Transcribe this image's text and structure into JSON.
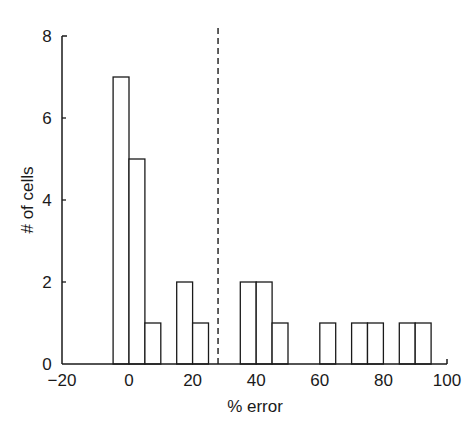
{
  "chart_data": {
    "type": "bar",
    "subtype": "histogram",
    "title": "",
    "xlabel": "% error",
    "ylabel": "# of cells",
    "xlim": [
      -20,
      100
    ],
    "ylim": [
      0,
      8
    ],
    "xticks": [
      -20,
      0,
      20,
      40,
      60,
      80,
      100
    ],
    "yticks": [
      0,
      2,
      4,
      6,
      8
    ],
    "grid": false,
    "legend": null,
    "bin_width": 5,
    "bins": [
      {
        "start": -5,
        "end": 0,
        "count": 7
      },
      {
        "start": 0,
        "end": 5,
        "count": 5
      },
      {
        "start": 5,
        "end": 10,
        "count": 1
      },
      {
        "start": 10,
        "end": 15,
        "count": 0
      },
      {
        "start": 15,
        "end": 20,
        "count": 2
      },
      {
        "start": 20,
        "end": 25,
        "count": 1
      },
      {
        "start": 25,
        "end": 30,
        "count": 0
      },
      {
        "start": 30,
        "end": 35,
        "count": 0
      },
      {
        "start": 35,
        "end": 40,
        "count": 2
      },
      {
        "start": 40,
        "end": 45,
        "count": 2
      },
      {
        "start": 45,
        "end": 50,
        "count": 1
      },
      {
        "start": 50,
        "end": 55,
        "count": 0
      },
      {
        "start": 55,
        "end": 60,
        "count": 0
      },
      {
        "start": 60,
        "end": 65,
        "count": 1
      },
      {
        "start": 65,
        "end": 70,
        "count": 0
      },
      {
        "start": 70,
        "end": 75,
        "count": 1
      },
      {
        "start": 75,
        "end": 80,
        "count": 1
      },
      {
        "start": 80,
        "end": 85,
        "count": 0
      },
      {
        "start": 85,
        "end": 90,
        "count": 1
      },
      {
        "start": 90,
        "end": 95,
        "count": 1
      }
    ],
    "categories": [
      "-5–0",
      "0–5",
      "5–10",
      "10–15",
      "15–20",
      "20–25",
      "25–30",
      "30–35",
      "35–40",
      "40–45",
      "45–50",
      "50–55",
      "55–60",
      "60–65",
      "65–70",
      "70–75",
      "75–80",
      "80–85",
      "85–90",
      "90–95"
    ],
    "values": [
      7,
      5,
      1,
      0,
      2,
      1,
      0,
      0,
      2,
      2,
      1,
      0,
      0,
      1,
      0,
      1,
      1,
      0,
      1,
      1
    ],
    "annotations": [
      {
        "type": "vline",
        "x": 28,
        "style": "dashed",
        "color": "#1a1a1a"
      }
    ],
    "colors": {
      "bar_fill": "#ffffff",
      "bar_stroke": "#1a1a1a",
      "axis": "#1a1a1a"
    }
  }
}
